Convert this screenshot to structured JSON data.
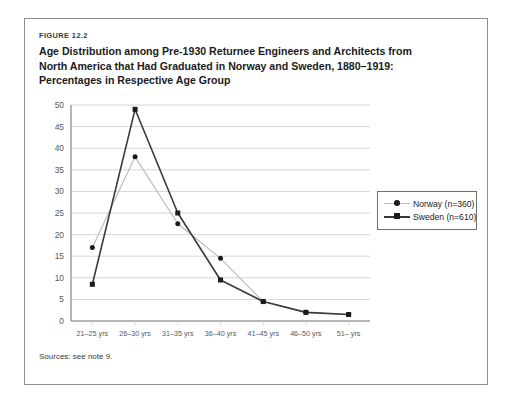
{
  "figure": {
    "label": "FIGURE 12.2",
    "title_lines": [
      "Age Distribution among Pre-1930 Returnee Engineers and Architects from",
      "North America that Had Graduated in Norway and Sweden, 1880–1919:",
      "Percentages in Respective Age Group"
    ],
    "source_note": "Sources: see note 9."
  },
  "colors": {
    "frame": "#8d8d8f",
    "text": "#231f20",
    "gridline": "#d0d0d2",
    "axis": "#6f6f72",
    "norway_line": "#b9b9bb",
    "sweden_line": "#3a3a3c",
    "marker": "#1b1b1d"
  },
  "chart_data": {
    "type": "line",
    "title": "Age Distribution among Pre-1930 Returnee Engineers and Architects from North America that Had Graduated in Norway and Sweden, 1880–1919: Percentages in Respective Age Group",
    "xlabel": "",
    "ylabel": "",
    "categories": [
      "21–25 yrs",
      "26–30 yrs",
      "31–35 yrs",
      "36–40 yrs",
      "41–45 yrs",
      "46–50 yrs",
      "51– yrs"
    ],
    "ylim": [
      0,
      50
    ],
    "yticks": [
      0,
      5,
      10,
      15,
      20,
      25,
      30,
      35,
      40,
      45,
      50
    ],
    "grid": true,
    "legend_position": "right",
    "series": [
      {
        "name": "Norway (n=360)",
        "marker": "circle",
        "color": "#b9b9bb",
        "values": [
          17,
          38,
          22.5,
          14.5,
          4.5,
          2,
          1.5
        ]
      },
      {
        "name": "Sweden (n=610)",
        "marker": "square",
        "color": "#3a3a3c",
        "values": [
          8.5,
          49,
          25,
          9.5,
          4.5,
          2,
          1.5
        ]
      }
    ]
  }
}
